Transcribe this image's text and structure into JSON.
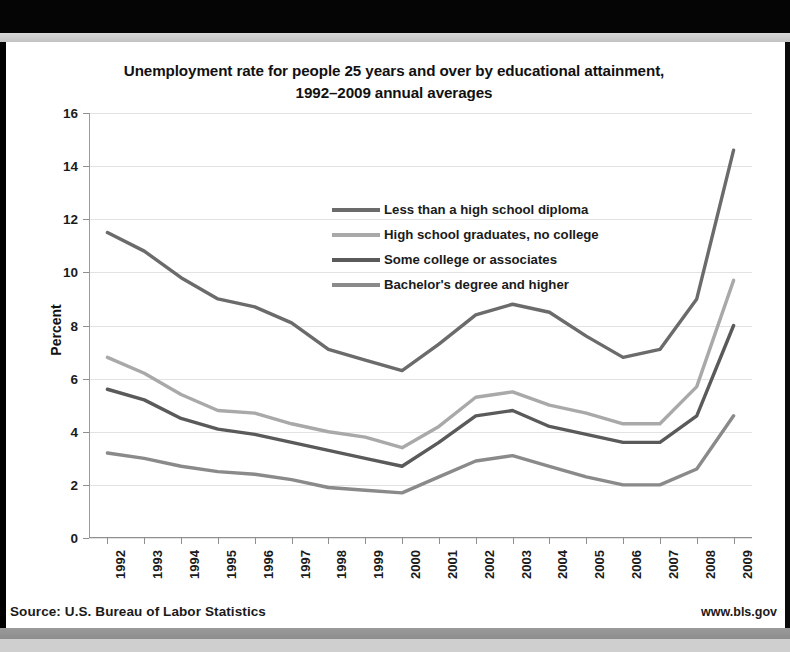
{
  "slide": {
    "title_line1": "Unemployment rate for people 25 years and over by educational attainment,",
    "title_line2": "1992–2009 annual averages",
    "footer_source": "Source: U.S. Bureau of Labor Statistics",
    "footer_url": "www.bls.gov"
  },
  "colors": {
    "series_less_than_hs": "#6b6b6b",
    "series_hs_grad": "#a9a9a9",
    "series_some_college": "#5a5a5a",
    "series_bachelors": "#8a8a8a",
    "gridline": "#e2e2e2",
    "axis": "#8f8f8f",
    "text": "#1b1b1b"
  },
  "chart_data": {
    "type": "line",
    "title": "Unemployment rate for people 25 years and over by educational attainment, 1992–2009 annual averages",
    "xlabel": "",
    "ylabel": "Percent",
    "ylim": [
      0,
      16
    ],
    "ytick_step": 2,
    "yticks": [
      "0",
      "2",
      "4",
      "6",
      "8",
      "10",
      "12",
      "14",
      "16"
    ],
    "grid": true,
    "legend_position": "inside-top-center",
    "categories": [
      "1992",
      "1993",
      "1994",
      "1995",
      "1996",
      "1997",
      "1998",
      "1999",
      "2000",
      "2001",
      "2002",
      "2003",
      "2004",
      "2005",
      "2006",
      "2007",
      "2008",
      "2009"
    ],
    "series": [
      {
        "name": "Less than a high school diploma",
        "color": "#6b6b6b",
        "values": [
          11.5,
          10.8,
          9.8,
          9.0,
          8.7,
          8.1,
          7.1,
          6.7,
          6.3,
          7.3,
          8.4,
          8.8,
          8.5,
          7.6,
          6.8,
          7.1,
          9.0,
          14.6
        ]
      },
      {
        "name": "High school graduates, no college",
        "color": "#a9a9a9",
        "values": [
          6.8,
          6.2,
          5.4,
          4.8,
          4.7,
          4.3,
          4.0,
          3.8,
          3.4,
          4.2,
          5.3,
          5.5,
          5.0,
          4.7,
          4.3,
          4.3,
          5.7,
          9.7
        ]
      },
      {
        "name": "Some college or associates",
        "color": "#5a5a5a",
        "values": [
          5.6,
          5.2,
          4.5,
          4.1,
          3.9,
          3.6,
          3.3,
          3.0,
          2.7,
          3.6,
          4.6,
          4.8,
          4.2,
          3.9,
          3.6,
          3.6,
          4.6,
          8.0
        ]
      },
      {
        "name": "Bachelor's degree and higher",
        "color": "#8a8a8a",
        "values": [
          3.2,
          3.0,
          2.7,
          2.5,
          2.4,
          2.2,
          1.9,
          1.8,
          1.7,
          2.3,
          2.9,
          3.1,
          2.7,
          2.3,
          2.0,
          2.0,
          2.6,
          4.6
        ]
      }
    ],
    "legend": [
      "Less than a high school diploma",
      "High school graduates, no college",
      "Some college or associates",
      "Bachelor's degree and higher"
    ]
  }
}
